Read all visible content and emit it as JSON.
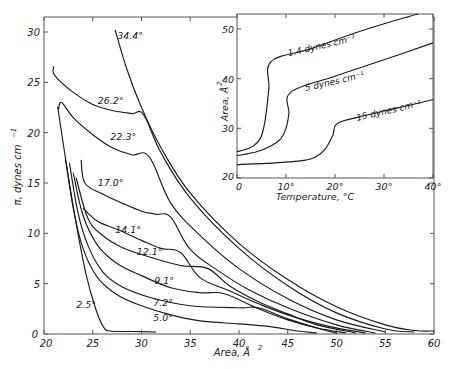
{
  "chart_data": [
    {
      "type": "line",
      "title": "",
      "xlabel": "Area, Å²",
      "ylabel": "π, dynes cm⁻¹",
      "xlim": [
        20,
        60
      ],
      "ylim": [
        0,
        30
      ],
      "xticks": [
        20,
        25,
        30,
        35,
        40,
        45,
        50,
        55,
        60
      ],
      "yticks": [
        0,
        5,
        10,
        15,
        20,
        25,
        30
      ],
      "grid": false,
      "legend": "inline curve labels",
      "series": [
        {
          "name": "2.5°",
          "label_at": [
            23.3,
            2.6
          ],
          "points": [
            [
              21.4,
              22.6
            ],
            [
              22.2,
              17.5
            ],
            [
              23.2,
              11.5
            ],
            [
              24.3,
              6
            ],
            [
              25.3,
              2.5
            ],
            [
              26.1,
              0.7
            ],
            [
              26.8,
              0.3
            ],
            [
              29,
              0.25
            ],
            [
              31.5,
              0.2
            ]
          ]
        },
        {
          "name": "5.0°",
          "label_at": [
            31.2,
            1.3
          ],
          "points": [
            [
              22.2,
              17.4
            ],
            [
              23,
              12.5
            ],
            [
              24,
              8.5
            ],
            [
              25.5,
              5.6
            ],
            [
              27.5,
              3.9
            ],
            [
              30,
              2.8
            ],
            [
              33,
              1.9
            ],
            [
              36,
              1.3
            ],
            [
              40,
              1.0
            ],
            [
              43,
              0.75
            ],
            [
              46,
              0.3
            ],
            [
              48,
              0.1
            ]
          ]
        },
        {
          "name": "7.2°",
          "label_at": [
            31.2,
            2.8
          ],
          "points": [
            [
              22.6,
              17
            ],
            [
              23.5,
              12
            ],
            [
              24.5,
              8.8
            ],
            [
              26,
              6.2
            ],
            [
              28,
              4.7
            ],
            [
              31,
              3.6
            ],
            [
              35,
              2.8
            ],
            [
              40,
              2.6
            ],
            [
              42,
              2.6
            ],
            [
              45,
              1.5
            ],
            [
              48,
              0.6
            ],
            [
              50,
              0.1
            ]
          ]
        },
        {
          "name": "9.1°",
          "label_at": [
            31.3,
            5.0
          ],
          "points": [
            [
              23,
              16
            ],
            [
              24,
              11.8
            ],
            [
              25.5,
              8.8
            ],
            [
              27.5,
              7
            ],
            [
              30,
              5.8
            ],
            [
              33,
              4.6
            ],
            [
              36,
              4.1
            ],
            [
              38.5,
              4.0
            ],
            [
              42,
              2.5
            ],
            [
              45,
              1.4
            ],
            [
              48,
              0.6
            ],
            [
              51,
              0.1
            ]
          ]
        },
        {
          "name": "12.1°",
          "label_at": [
            29.5,
            7.8
          ],
          "points": [
            [
              23.3,
              15.5
            ],
            [
              24.5,
              11.5
            ],
            [
              26,
              9.8
            ],
            [
              28,
              8.6
            ],
            [
              31,
              7.6
            ],
            [
              34,
              6.8
            ],
            [
              36.8,
              6.5
            ],
            [
              39,
              4.8
            ],
            [
              42,
              3.2
            ],
            [
              45,
              2
            ],
            [
              48,
              0.9
            ],
            [
              52,
              0.1
            ]
          ]
        },
        {
          "name": "14.1°",
          "label_at": [
            27.3,
            10.0
          ],
          "points": [
            [
              24,
              12.5
            ],
            [
              25.5,
              11.2
            ],
            [
              27.5,
              10.4
            ],
            [
              30,
              9.3
            ],
            [
              32,
              8.5
            ],
            [
              34,
              8.1
            ],
            [
              36,
              5.6
            ],
            [
              39,
              4.3
            ],
            [
              42,
              3
            ],
            [
              45,
              1.9
            ],
            [
              49,
              0.8
            ],
            [
              53,
              0.1
            ]
          ]
        },
        {
          "name": "17.0°",
          "label_at": [
            25.5,
            14.7
          ],
          "points": [
            [
              23.8,
              17.3
            ],
            [
              24.2,
              15
            ],
            [
              26,
              13.9
            ],
            [
              28,
              13
            ],
            [
              30,
              12.2
            ],
            [
              31.5,
              11.9
            ],
            [
              33,
              11.6
            ],
            [
              35,
              8.4
            ],
            [
              38,
              6.2
            ],
            [
              41,
              4.4
            ],
            [
              45,
              2.6
            ],
            [
              50,
              0.9
            ],
            [
              54,
              0.1
            ]
          ]
        },
        {
          "name": "22.3°",
          "label_at": [
            26.8,
            19.3
          ],
          "points": [
            [
              21.5,
              22.3
            ],
            [
              21.8,
              23
            ],
            [
              23,
              21.5
            ],
            [
              25,
              19.8
            ],
            [
              27,
              18.5
            ],
            [
              29,
              17.8
            ],
            [
              30.8,
              17.6
            ],
            [
              33,
              13
            ],
            [
              36,
              9.8
            ],
            [
              40,
              6.5
            ],
            [
              45,
              3.5
            ],
            [
              50,
              1.4
            ],
            [
              55,
              0.2
            ]
          ]
        },
        {
          "name": "26.2°",
          "label_at": [
            25.5,
            22.8
          ],
          "points": [
            [
              21,
              26.6
            ],
            [
              21.1,
              25.7
            ],
            [
              23,
              24
            ],
            [
              25,
              22.8
            ],
            [
              27,
              22.2
            ],
            [
              29,
              21.9
            ],
            [
              30.2,
              21.8
            ],
            [
              32,
              18
            ],
            [
              35,
              13.5
            ],
            [
              40,
              8.5
            ],
            [
              45,
              4.8
            ],
            [
              50,
              2.1
            ],
            [
              55,
              0.5
            ],
            [
              58,
              0.2
            ]
          ]
        },
        {
          "name": "34.4°",
          "label_at": [
            27.5,
            29.3
          ],
          "points": [
            [
              27.3,
              30.2
            ],
            [
              28.5,
              26.3
            ],
            [
              30,
              22.5
            ],
            [
              32,
              18.5
            ],
            [
              35,
              14
            ],
            [
              40,
              9
            ],
            [
              45,
              5.4
            ],
            [
              50,
              2.7
            ],
            [
              55,
              0.9
            ],
            [
              58,
              0.35
            ],
            [
              60,
              0.3
            ]
          ]
        }
      ]
    },
    {
      "type": "line",
      "title": "",
      "xlabel": "Temperature, °C",
      "ylabel": "Area, Å²",
      "xlim": [
        0,
        40
      ],
      "ylim": [
        20,
        53
      ],
      "xticks": [
        0,
        10,
        20,
        30,
        40
      ],
      "xtick_labels": [
        "0",
        "10°",
        "20°",
        "30°",
        "40°"
      ],
      "yticks": [
        20,
        30,
        40,
        50
      ],
      "grid": false,
      "legend": "inline curve labels",
      "series": [
        {
          "name": "1.4 dynes cm⁻¹",
          "label_at": [
            10.5,
            44.5
          ],
          "points": [
            [
              0,
              25.3
            ],
            [
              2.5,
              26
            ],
            [
              4,
              27
            ],
            [
              5,
              28.5
            ],
            [
              5.8,
              32
            ],
            [
              6.5,
              38
            ],
            [
              7,
              43.5
            ],
            [
              15,
              46
            ],
            [
              25,
              49.5
            ],
            [
              35,
              52.5
            ],
            [
              37,
              53
            ]
          ]
        },
        {
          "name": "5 dynes cm⁻¹",
          "label_at": [
            14,
            37.5
          ],
          "points": [
            [
              0,
              24.5
            ],
            [
              4,
              25.3
            ],
            [
              7,
              26.5
            ],
            [
              9,
              28
            ],
            [
              10,
              30
            ],
            [
              10.6,
              33
            ],
            [
              11,
              37.3
            ],
            [
              20,
              40.5
            ],
            [
              30,
              43.8
            ],
            [
              40,
              47.2
            ]
          ]
        },
        {
          "name": "15 dynes cm⁻¹",
          "label_at": [
            24.5,
            31.5
          ],
          "points": [
            [
              0,
              22.7
            ],
            [
              5,
              22.9
            ],
            [
              10,
              23.2
            ],
            [
              14,
              23.6
            ],
            [
              16,
              24.2
            ],
            [
              18,
              25.8
            ],
            [
              19.5,
              28.5
            ],
            [
              20.5,
              31
            ],
            [
              25,
              32.3
            ],
            [
              30,
              33.5
            ],
            [
              35,
              34.6
            ],
            [
              40,
              35.8
            ]
          ]
        }
      ]
    }
  ],
  "labels": {
    "main_xlabel": "Area, Å",
    "main_xlabel_sup": "2",
    "main_ylabel": "π, dynes cm",
    "main_ylabel_sup": "−1",
    "inset_xlabel": "Temperature, °C",
    "inset_ylabel": "Area, Å",
    "inset_ylabel_sup": "2",
    "main_x0_label": "0",
    "inset_y0_label": "20"
  }
}
